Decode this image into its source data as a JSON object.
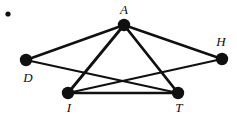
{
  "figure": {
    "kind": "undirected-graph-diagram",
    "width": 237,
    "height": 115,
    "background_color": "#ffffff",
    "ink_color": "#101010",
    "bullet": {
      "name": "bullet-marker",
      "x": 8,
      "y": 14,
      "radius": 2.6
    },
    "vertices": [
      {
        "id": "A",
        "label": "A",
        "x": 124,
        "y": 25,
        "radius": 6.2,
        "label_x": 124,
        "label_y": 9
      },
      {
        "id": "D",
        "label": "D",
        "x": 26,
        "y": 60,
        "radius": 6.2,
        "label_x": 28,
        "label_y": 77
      },
      {
        "id": "H",
        "label": "H",
        "x": 222,
        "y": 59,
        "radius": 6.2,
        "label_x": 221,
        "label_y": 41
      },
      {
        "id": "I",
        "label": "I",
        "x": 68,
        "y": 93,
        "radius": 6.2,
        "label_x": 69,
        "label_y": 107
      },
      {
        "id": "T",
        "label": "T",
        "x": 178,
        "y": 93,
        "radius": 6.2,
        "label_x": 179,
        "label_y": 107
      }
    ],
    "edges": [
      {
        "id": "A-D",
        "from": "A",
        "to": "D",
        "width": 2.4
      },
      {
        "id": "A-H",
        "from": "A",
        "to": "H",
        "width": 2.4
      },
      {
        "id": "A-I",
        "from": "A",
        "to": "I",
        "width": 2.8
      },
      {
        "id": "A-T",
        "from": "A",
        "to": "T",
        "width": 2.8
      },
      {
        "id": "D-T",
        "from": "D",
        "to": "T",
        "width": 2.2
      },
      {
        "id": "I-H",
        "from": "I",
        "to": "H",
        "width": 2.2
      },
      {
        "id": "I-T",
        "from": "I",
        "to": "T",
        "width": 2.4
      }
    ]
  }
}
